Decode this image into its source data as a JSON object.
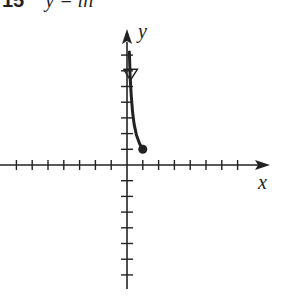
{
  "header": {
    "problem_number": "15",
    "equation": "y = ln",
    "clipped": true
  },
  "chart_data": {
    "type": "line",
    "title": "",
    "xlabel": "x",
    "ylabel": "y",
    "xlim": [
      -8,
      8
    ],
    "ylim": [
      -7,
      7
    ],
    "x_ticks": [
      -7,
      -6,
      -5,
      -4,
      -3,
      -2,
      -1,
      1,
      2,
      3,
      4,
      5,
      6,
      7
    ],
    "y_ticks": [
      -7,
      -6,
      -5,
      -4,
      -3,
      -2,
      -1,
      1,
      2,
      3,
      4,
      5,
      6,
      7
    ],
    "tick_labels_shown": false,
    "grid": false,
    "series": [
      {
        "name": "curve",
        "points": [
          [
            1,
            1
          ],
          [
            0.8,
            1.35
          ],
          [
            0.6,
            1.9
          ],
          [
            0.45,
            2.6
          ],
          [
            0.35,
            3.4
          ],
          [
            0.27,
            4.4
          ],
          [
            0.2,
            5.6
          ],
          [
            0.15,
            7.2
          ]
        ],
        "endpoint": {
          "x": 1,
          "y": 1,
          "style": "closed-dot"
        },
        "direction_arrow": {
          "x": 0.22,
          "y": 5.4,
          "style": "hollow-arrowhead-down"
        },
        "asymptote": "approaches y-axis as y increases"
      }
    ]
  },
  "colors": {
    "ink": "#222222",
    "background": "#ffffff"
  }
}
